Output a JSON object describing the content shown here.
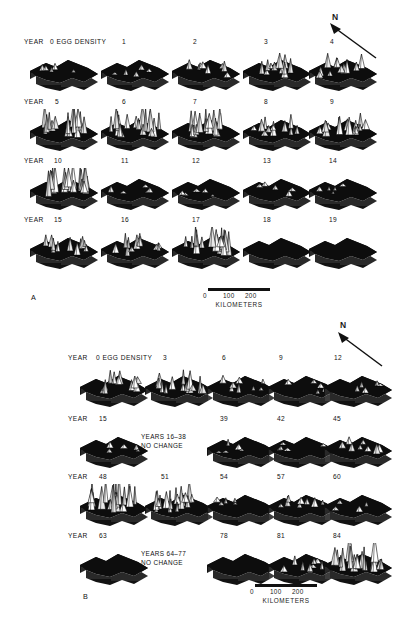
{
  "figure": {
    "panels": [
      {
        "id": "A",
        "letter": "A",
        "north_label": "N",
        "rows": [
          {
            "lead_label": "YEAR",
            "density_label": "0 EGG DENSITY",
            "cells": [
              {
                "label": "1",
                "peaks": "low"
              },
              {
                "label": "2",
                "peaks": "low"
              },
              {
                "label": "3",
                "peaks": "low-mid"
              },
              {
                "label": "4",
                "peaks": "mid"
              },
              {
                "label": "",
                "peaks": "none"
              }
            ]
          },
          {
            "lead_label": "YEAR",
            "density_label": "",
            "cells": [
              {
                "label": "5",
                "peaks": "high"
              },
              {
                "label": "6",
                "peaks": "high"
              },
              {
                "label": "7",
                "peaks": "high"
              },
              {
                "label": "8",
                "peaks": "mid"
              },
              {
                "label": "9",
                "peaks": "mid-high"
              }
            ]
          },
          {
            "lead_label": "YEAR",
            "density_label": "",
            "cells": [
              {
                "label": "10",
                "peaks": "very-high"
              },
              {
                "label": "11",
                "peaks": "low"
              },
              {
                "label": "12",
                "peaks": "low"
              },
              {
                "label": "13",
                "peaks": "low"
              },
              {
                "label": "14",
                "peaks": "low"
              }
            ]
          },
          {
            "lead_label": "YEAR",
            "density_label": "",
            "cells": [
              {
                "label": "15",
                "peaks": "mid"
              },
              {
                "label": "16",
                "peaks": "mid"
              },
              {
                "label": "17",
                "peaks": "high"
              },
              {
                "label": "18",
                "peaks": "none"
              },
              {
                "label": "19",
                "peaks": "none"
              }
            ]
          }
        ],
        "scale": {
          "zero": "0",
          "mid": "100",
          "max": "200",
          "units": "KILOMETERS"
        }
      },
      {
        "id": "B",
        "letter": "B",
        "north_label": "N",
        "rows": [
          {
            "lead_label": "YEAR",
            "density_label": "0 EGG DENSITY",
            "note": "",
            "cells": [
              {
                "label": "3",
                "peaks": "mid"
              },
              {
                "label": "6",
                "peaks": "mid-high"
              },
              {
                "label": "9",
                "peaks": "low-mid"
              },
              {
                "label": "12",
                "peaks": "low"
              },
              {
                "label": "",
                "peaks": "low"
              }
            ]
          },
          {
            "lead_label": "YEAR",
            "density_label": "",
            "note": "YEARS 16–38\nNO CHANGE",
            "cells": [
              {
                "label": "15",
                "peaks": "low"
              },
              {
                "label": "39",
                "peaks": "low"
              },
              {
                "label": "42",
                "peaks": "low"
              },
              {
                "label": "45",
                "peaks": "low-mid"
              },
              {
                "label": "",
                "peaks": "none"
              }
            ]
          },
          {
            "lead_label": "YEAR",
            "density_label": "",
            "note": "",
            "cells": [
              {
                "label": "48",
                "peaks": "very-high"
              },
              {
                "label": "51",
                "peaks": "high"
              },
              {
                "label": "54",
                "peaks": "low"
              },
              {
                "label": "57",
                "peaks": "low-mid"
              },
              {
                "label": "60",
                "peaks": "low"
              }
            ]
          },
          {
            "lead_label": "YEAR",
            "density_label": "",
            "note": "YEARS 64–77\nNO CHANGE",
            "cells": [
              {
                "label": "63",
                "peaks": "none"
              },
              {
                "label": "78",
                "peaks": "none"
              },
              {
                "label": "81",
                "peaks": "low-mid"
              },
              {
                "label": "84",
                "peaks": "very-high"
              },
              {
                "label": "",
                "peaks": "none"
              }
            ]
          }
        ],
        "scale": {
          "zero": "0",
          "mid": "100",
          "max": "200",
          "units": "KILOMETERS"
        }
      }
    ]
  }
}
